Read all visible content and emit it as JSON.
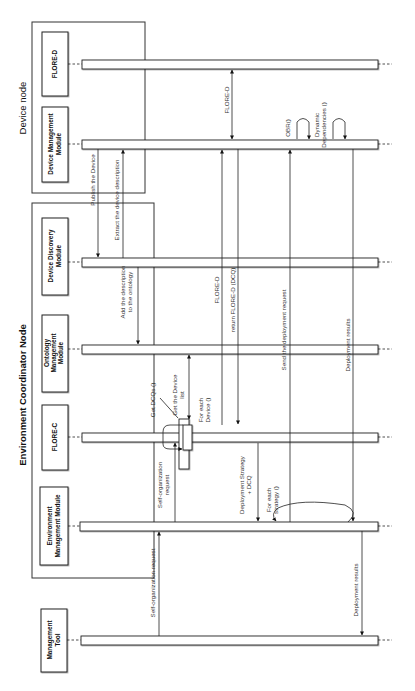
{
  "diagram": {
    "type": "sequence-diagram",
    "orientation": "rotated-90-ccw",
    "nodes": [
      {
        "id": "device_node",
        "title": "Device node"
      },
      {
        "id": "env_node",
        "title": "Environment Coordinator Node"
      }
    ],
    "participants": [
      {
        "id": "flore_d",
        "line1": "FLORE-D",
        "line2": "",
        "line3": ""
      },
      {
        "id": "dmm",
        "line1": "Device Management",
        "line2": "Module",
        "line3": ""
      },
      {
        "id": "ddm",
        "line1": "Device Discovery",
        "line2": "Module",
        "line3": ""
      },
      {
        "id": "omm",
        "line1": "Ontology",
        "line2": "Management",
        "line3": "Module"
      },
      {
        "id": "flore_c",
        "line1": "FLORE-C",
        "line2": "",
        "line3": ""
      },
      {
        "id": "emm",
        "line1": "Environment",
        "line2": "Management Module",
        "line3": ""
      },
      {
        "id": "mt",
        "line1": "Management",
        "line2": "Tool",
        "line3": ""
      }
    ],
    "messages": [
      {
        "id": "m1",
        "from": "dmm",
        "to": "ddm",
        "line1": "Publish the Device",
        "line2": ""
      },
      {
        "id": "m2",
        "from": "ddm",
        "to": "dmm",
        "line1": "Extract the device description",
        "line2": ""
      },
      {
        "id": "m3",
        "from": "ddm",
        "to": "omm",
        "line1": "Add the description",
        "line2": "to the ontology"
      },
      {
        "id": "m4",
        "from": "mt",
        "to": "emm",
        "line1": "Self-organization request",
        "line2": ""
      },
      {
        "id": "m5",
        "from": "emm",
        "to": "flore_c",
        "line1": "Self-organization",
        "line2": "request"
      },
      {
        "id": "m6",
        "from": "flore_c",
        "to": "flore_c",
        "line1": "Get DCQs ()",
        "line2": ""
      },
      {
        "id": "m7",
        "from": "flore_c",
        "to": "omm",
        "line1": "Get the Device",
        "line2": "list"
      },
      {
        "id": "m8",
        "from": "flore_c",
        "to": "flore_c",
        "line1": "For each",
        "line2": "Device ()"
      },
      {
        "id": "m9",
        "from": "flore_c",
        "to": "flore_d",
        "line1": "FLORE-D",
        "line2": ""
      },
      {
        "id": "m10",
        "from": "flore_d",
        "to": "dmm",
        "line1": "FLORE-D",
        "line2": ""
      },
      {
        "id": "m11",
        "from": "dmm",
        "to": "flore_c",
        "line1": "return FLORE-D (DCQ)",
        "line2": ""
      },
      {
        "id": "m12",
        "from": "flore_c",
        "to": "emm",
        "line1": "Deployment Strategy",
        "line2": "+ DCQ"
      },
      {
        "id": "m13",
        "from": "emm",
        "to": "emm",
        "line1": "For each",
        "line2": "strategy  ()"
      },
      {
        "id": "m14",
        "from": "emm",
        "to": "dmm",
        "line1": "Send the deployment request",
        "line2": ""
      },
      {
        "id": "m15",
        "from": "dmm",
        "to": "dmm",
        "line1": "OBR()",
        "line2": ""
      },
      {
        "id": "m16",
        "from": "dmm",
        "to": "dmm",
        "line1": "Dynamic",
        "line2": "Dependencies ()"
      },
      {
        "id": "m17",
        "from": "dmm",
        "to": "emm",
        "line1": "Deployment results",
        "line2": ""
      },
      {
        "id": "m18",
        "from": "emm",
        "to": "mt",
        "line1": "Deployment results",
        "line2": ""
      }
    ],
    "colors": {
      "stroke": "#222222",
      "background": "#ffffff",
      "text": "#333333"
    }
  }
}
